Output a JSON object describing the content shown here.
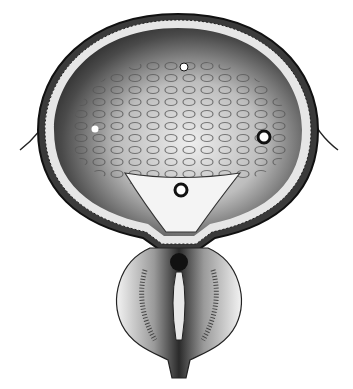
{
  "figure": {
    "style": "grayscale engraving",
    "background": "#ffffff",
    "colors": {
      "ink": "#1a1a1a",
      "dark_fill": "#2b2b2b",
      "mid_gray": "#777777",
      "light_gray": "#cfcfcf",
      "highlight": "#f4f4f4"
    },
    "features": [
      {
        "name": "bladder-wall-outer",
        "cx": 178,
        "cy": 130,
        "rx": 140,
        "ry": 118
      },
      {
        "name": "ureter-opening-top",
        "cx": 184,
        "cy": 67,
        "r": 4
      },
      {
        "name": "ureter-opening-left",
        "cx": 95,
        "cy": 129,
        "r": 3.5
      },
      {
        "name": "ureter-opening-right",
        "cx": 264,
        "cy": 137,
        "r": 6
      },
      {
        "name": "trigone-dot",
        "cx": 181,
        "cy": 190,
        "r": 6
      },
      {
        "name": "internal-urethral-orifice",
        "cx": 179,
        "cy": 262,
        "r": 9
      }
    ]
  }
}
